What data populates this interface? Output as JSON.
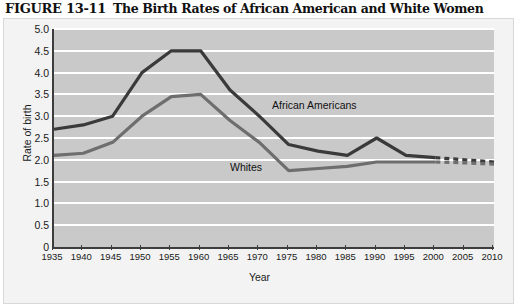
{
  "figure": {
    "number": "FIGURE 13-11",
    "title": "The Birth Rates of African American and White Women"
  },
  "colors": {
    "plot_background": "#c9c9c9",
    "card_background": "#f3f3f3",
    "gridline": "#ffffff",
    "axis": "#3d3d3d",
    "african_americans": "#3a3a3a",
    "whites": "#6e6e6e"
  },
  "chart_data": {
    "type": "line",
    "title": "The Birth Rates of African American and White Women",
    "xlabel": "Year",
    "ylabel": "Rate of birth",
    "xlim": [
      1935,
      2010
    ],
    "ylim": [
      0,
      5.0
    ],
    "ytick_labels": [
      "5.0",
      "4.5",
      "4.0",
      "3.5",
      "3.0",
      "2.5",
      "2.0",
      "1.5",
      "1.0",
      "0.5",
      "0"
    ],
    "ytick_values": [
      5.0,
      4.5,
      4.0,
      3.5,
      3.0,
      2.5,
      2.0,
      1.5,
      1.0,
      0.5,
      0
    ],
    "grid": true,
    "legend": "inline-annotations",
    "categories": [
      1935,
      1940,
      1945,
      1950,
      1955,
      1960,
      1965,
      1970,
      1975,
      1980,
      1985,
      1990,
      1995,
      2000,
      2005,
      2010
    ],
    "xtick_labels": [
      "1935",
      "1940",
      "1945",
      "1950",
      "1955",
      "1960",
      "1965",
      "1970",
      "1975",
      "1980",
      "1985",
      "1990",
      "1995",
      "2000",
      "2005",
      "2010"
    ],
    "series": [
      {
        "name": "African Americans",
        "color": "#3a3a3a",
        "solid_through": 2000,
        "dashed_from": 2000,
        "values": [
          2.7,
          2.8,
          3.0,
          4.0,
          4.5,
          4.5,
          3.6,
          3.0,
          2.35,
          2.2,
          2.1,
          2.5,
          2.1,
          2.05,
          2.0,
          1.95
        ]
      },
      {
        "name": "Whites",
        "color": "#6e6e6e",
        "solid_through": 2000,
        "dashed_from": 2000,
        "values": [
          2.1,
          2.15,
          2.4,
          3.0,
          3.45,
          3.5,
          2.9,
          2.4,
          1.75,
          1.8,
          1.85,
          1.95,
          1.95,
          1.95,
          1.93,
          1.9
        ]
      }
    ],
    "annotations": [
      {
        "text": "African Americans",
        "series": "African Americans"
      },
      {
        "text": "Whites",
        "series": "Whites"
      }
    ]
  }
}
